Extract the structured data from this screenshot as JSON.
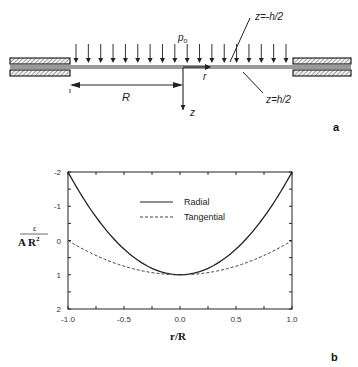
{
  "figure_a": {
    "panel_label": "a",
    "load_label": "p",
    "load_subscript": "o",
    "radius_label": "R",
    "radial_coord_label": "r",
    "axis_z_label": "z",
    "top_surface_label": "z=-h/2",
    "bottom_surface_label": "z=h/2",
    "arrow_count": 18
  },
  "figure_b": {
    "panel_label": "b",
    "ylabel_numerator": "ε",
    "ylabel_denominator": "A R",
    "ylabel_exponent": "2",
    "xlabel": "r/R",
    "legend": [
      {
        "label": "Radial",
        "style": "solid"
      },
      {
        "label": "Tangential",
        "style": "dashed"
      }
    ],
    "xticks": [
      "-1.0",
      "-0.5",
      "0.0",
      "0.5",
      "1.0"
    ],
    "yticks": [
      "-2",
      "-1",
      "0",
      "1",
      "2"
    ]
  },
  "chart_data": {
    "type": "line",
    "title": "",
    "xlabel": "r/R",
    "ylabel": "ε / (A R²)",
    "xlim": [
      -1.0,
      1.0
    ],
    "ylim": [
      2,
      -2
    ],
    "y_inverted": true,
    "grid": false,
    "legend_position": "upper center",
    "x": [
      -1.0,
      -0.75,
      -0.5,
      -0.25,
      0.0,
      0.25,
      0.5,
      0.75,
      1.0
    ],
    "series": [
      {
        "name": "Radial",
        "style": "solid",
        "values": [
          -2.0,
          -0.69,
          0.25,
          0.81,
          1.0,
          0.81,
          0.25,
          -0.69,
          -2.0
        ]
      },
      {
        "name": "Tangential",
        "style": "dashed",
        "values": [
          0.0,
          0.44,
          0.75,
          0.94,
          1.0,
          0.94,
          0.75,
          0.44,
          0.0
        ]
      }
    ],
    "xticks": [
      -1.0,
      -0.5,
      0.0,
      0.5,
      1.0
    ],
    "yticks": [
      -2,
      -1,
      0,
      1,
      2
    ]
  }
}
